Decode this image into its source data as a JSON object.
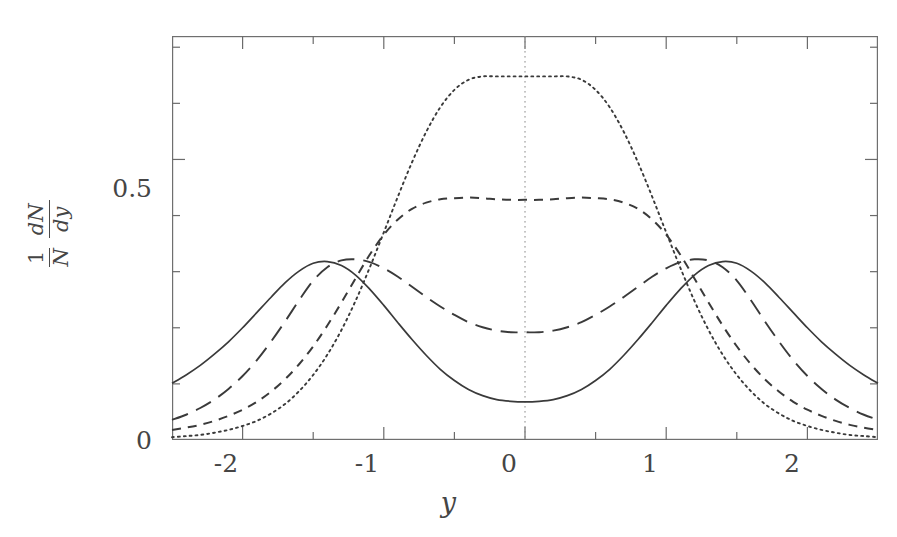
{
  "figure": {
    "background_color": "#ffffff",
    "line_color": "#3a3a3a",
    "axis_color": "#6b6b6b"
  },
  "axes": {
    "x_title": "y",
    "y_title_parts": {
      "one": "1",
      "N": "N",
      "dN": "dN",
      "dy": "dy"
    },
    "x_tick_labels": [
      "-2",
      "-1",
      "0",
      "1",
      "2"
    ],
    "x_tick_values": [
      -2,
      -1,
      0,
      1,
      2
    ],
    "y_tick_labels": [
      "0",
      "0.5"
    ],
    "y_tick_values": [
      0,
      0.5
    ],
    "x_minor_step": 0.5,
    "y_minor_step": 0.1
  },
  "chart_data": {
    "type": "line",
    "title": "",
    "xlabel": "y",
    "ylabel": "1/N dN/dy",
    "xlim": [
      -2.5,
      2.5
    ],
    "ylim": [
      0,
      0.72
    ],
    "grid": false,
    "legend": "none",
    "x": [
      -2.5,
      -2.4,
      -2.3,
      -2.2,
      -2.1,
      -2.0,
      -1.9,
      -1.8,
      -1.7,
      -1.6,
      -1.5,
      -1.4,
      -1.3,
      -1.2,
      -1.1,
      -1.0,
      -0.9,
      -0.8,
      -0.7,
      -0.6,
      -0.5,
      -0.4,
      -0.3,
      -0.2,
      -0.1,
      0.0,
      0.1,
      0.2,
      0.3,
      0.4,
      0.5,
      0.6,
      0.7,
      0.8,
      0.9,
      1.0,
      1.1,
      1.2,
      1.3,
      1.4,
      1.5,
      1.6,
      1.7,
      1.8,
      1.9,
      2.0,
      2.1,
      2.2,
      2.3,
      2.4,
      2.5
    ],
    "series": [
      {
        "name": "solid",
        "style": "solid",
        "peak_positions": [
          -1.5,
          1.5
        ],
        "peak_value": 0.315,
        "center_value": 0.068,
        "edge_value": 0.101,
        "values": [
          0.101,
          0.116,
          0.133,
          0.153,
          0.175,
          0.2,
          0.227,
          0.254,
          0.28,
          0.301,
          0.315,
          0.318,
          0.311,
          0.294,
          0.269,
          0.24,
          0.209,
          0.179,
          0.151,
          0.126,
          0.106,
          0.09,
          0.079,
          0.072,
          0.069,
          0.068,
          0.069,
          0.072,
          0.079,
          0.09,
          0.106,
          0.126,
          0.151,
          0.179,
          0.209,
          0.24,
          0.269,
          0.294,
          0.311,
          0.318,
          0.315,
          0.301,
          0.28,
          0.254,
          0.227,
          0.2,
          0.175,
          0.153,
          0.133,
          0.116,
          0.101
        ]
      },
      {
        "name": "long-dashed",
        "style": "long-dashed",
        "peak_positions": [
          -1.0,
          1.0
        ],
        "peak_value": 0.322,
        "center_value": 0.192,
        "edge_value": 0.036,
        "values": [
          0.036,
          0.045,
          0.057,
          0.072,
          0.091,
          0.114,
          0.142,
          0.175,
          0.211,
          0.249,
          0.284,
          0.308,
          0.32,
          0.322,
          0.317,
          0.306,
          0.291,
          0.273,
          0.255,
          0.238,
          0.223,
          0.21,
          0.201,
          0.195,
          0.192,
          0.192,
          0.192,
          0.195,
          0.201,
          0.21,
          0.223,
          0.238,
          0.255,
          0.273,
          0.291,
          0.306,
          0.317,
          0.322,
          0.32,
          0.308,
          0.284,
          0.249,
          0.211,
          0.175,
          0.142,
          0.114,
          0.091,
          0.072,
          0.057,
          0.045,
          0.036
        ]
      },
      {
        "name": "short-dashed",
        "style": "short-dashed",
        "peak_positions": [
          -0.25,
          0.25
        ],
        "peak_value": 0.432,
        "center_value": 0.428,
        "edge_value": 0.018,
        "values": [
          0.018,
          0.022,
          0.027,
          0.034,
          0.043,
          0.054,
          0.068,
          0.086,
          0.108,
          0.135,
          0.167,
          0.204,
          0.245,
          0.288,
          0.33,
          0.366,
          0.393,
          0.412,
          0.423,
          0.429,
          0.431,
          0.432,
          0.431,
          0.429,
          0.428,
          0.428,
          0.428,
          0.429,
          0.431,
          0.432,
          0.431,
          0.429,
          0.423,
          0.412,
          0.393,
          0.366,
          0.33,
          0.288,
          0.245,
          0.204,
          0.167,
          0.135,
          0.108,
          0.086,
          0.068,
          0.054,
          0.043,
          0.034,
          0.027,
          0.022,
          0.018
        ]
      },
      {
        "name": "dotted",
        "style": "dotted",
        "peak_positions": [
          0.0
        ],
        "peak_value": 0.648,
        "center_value": 0.648,
        "edge_value": 0.005,
        "values": [
          0.005,
          0.007,
          0.009,
          0.013,
          0.018,
          0.025,
          0.034,
          0.047,
          0.064,
          0.087,
          0.116,
          0.152,
          0.196,
          0.248,
          0.307,
          0.37,
          0.434,
          0.495,
          0.549,
          0.593,
          0.624,
          0.642,
          0.648,
          0.648,
          0.648,
          0.648,
          0.648,
          0.648,
          0.648,
          0.642,
          0.624,
          0.593,
          0.549,
          0.495,
          0.434,
          0.37,
          0.307,
          0.248,
          0.196,
          0.152,
          0.116,
          0.087,
          0.064,
          0.047,
          0.034,
          0.025,
          0.018,
          0.013,
          0.009,
          0.007,
          0.005
        ]
      }
    ],
    "center_guide_line": {
      "x": 0,
      "style": "dotted",
      "from_y": 0,
      "to_y": 0.72
    }
  }
}
